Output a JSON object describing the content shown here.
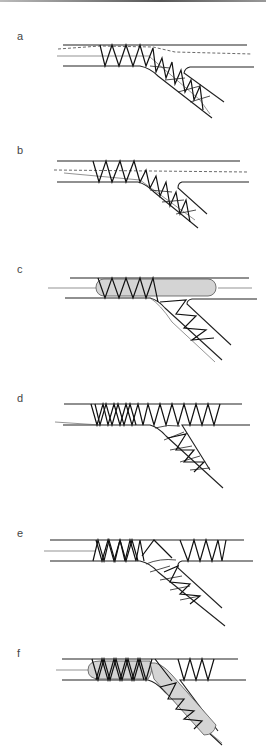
{
  "figure": {
    "panels": [
      {
        "label": "a",
        "content": "Stent placed in main vessel and side branch with guide wires (dashed)"
      },
      {
        "label": "b",
        "content": "Side-branch stent with wire recrossed into main vessel"
      },
      {
        "label": "c",
        "content": "Balloon (shaded) inflated in main vessel across stent"
      },
      {
        "label": "d",
        "content": "Main vessel stent deployed, overlapping side branch origin"
      },
      {
        "label": "e",
        "content": "Wire recrossing struts into side branch"
      },
      {
        "label": "f",
        "content": "Kissing balloon inflation (shaded) in main vessel and side branch"
      }
    ]
  },
  "colors": {
    "line": "#222222",
    "balloon_fill": "#d4d4d4",
    "label": "#444444"
  }
}
